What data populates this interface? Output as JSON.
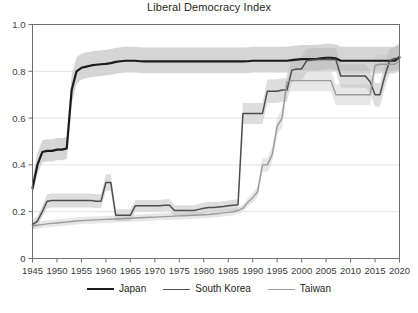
{
  "chart_data": {
    "type": "line",
    "title": "Liberal Democracy Index",
    "xlabel": "",
    "ylabel": "",
    "xlim": [
      1945,
      2020
    ],
    "ylim": [
      0,
      1.0
    ],
    "grid": true,
    "grid_axis": "y",
    "legend_position": "bottom",
    "xticks": [
      1945,
      1950,
      1955,
      1960,
      1965,
      1970,
      1975,
      1980,
      1985,
      1990,
      1995,
      2000,
      2005,
      2010,
      2015,
      2020
    ],
    "xtick_labels": [
      "1945",
      "1950",
      "1955",
      "1960",
      "1965",
      "1970",
      "1975",
      "1980",
      "1985",
      "1990",
      "1995",
      "2000",
      "2005",
      "2010",
      "2015",
      "2020"
    ],
    "yticks": [
      0,
      0.2,
      0.4,
      0.6,
      0.8,
      1.0
    ],
    "ytick_labels": [
      "0",
      "0.2",
      "0.4",
      "0.6",
      "0.8",
      "1.0"
    ],
    "series": [
      {
        "name": "Japan",
        "color": "#1a1a1a",
        "width": 2.2,
        "band_color": "#b3b3b3",
        "band_opacity": 0.55,
        "x": [
          1945,
          1946,
          1947,
          1948,
          1949,
          1950,
          1951,
          1952,
          1953,
          1954,
          1955,
          1956,
          1957,
          1958,
          1959,
          1960,
          1961,
          1962,
          1963,
          1964,
          1965,
          1966,
          1967,
          1968,
          1969,
          1970,
          1971,
          1972,
          1973,
          1974,
          1975,
          1976,
          1977,
          1978,
          1979,
          1980,
          1981,
          1982,
          1983,
          1984,
          1985,
          1986,
          1987,
          1988,
          1989,
          1990,
          1991,
          1992,
          1993,
          1994,
          1995,
          1996,
          1997,
          1998,
          1999,
          2000,
          2001,
          2002,
          2003,
          2004,
          2005,
          2006,
          2007,
          2008,
          2009,
          2010,
          2011,
          2012,
          2013,
          2014,
          2015,
          2016,
          2017,
          2018,
          2019,
          2020
        ],
        "y": [
          0.3,
          0.4,
          0.455,
          0.46,
          0.46,
          0.465,
          0.465,
          0.47,
          0.72,
          0.8,
          0.815,
          0.82,
          0.825,
          0.828,
          0.83,
          0.832,
          0.835,
          0.84,
          0.843,
          0.845,
          0.845,
          0.845,
          0.843,
          0.842,
          0.842,
          0.842,
          0.842,
          0.842,
          0.842,
          0.842,
          0.842,
          0.842,
          0.842,
          0.842,
          0.842,
          0.842,
          0.842,
          0.842,
          0.842,
          0.842,
          0.842,
          0.842,
          0.842,
          0.842,
          0.843,
          0.845,
          0.845,
          0.845,
          0.845,
          0.845,
          0.845,
          0.845,
          0.845,
          0.848,
          0.85,
          0.852,
          0.852,
          0.852,
          0.852,
          0.855,
          0.858,
          0.858,
          0.855,
          0.845,
          0.845,
          0.845,
          0.845,
          0.845,
          0.845,
          0.845,
          0.845,
          0.845,
          0.845,
          0.845,
          0.845,
          0.86
        ],
        "y_low": [
          0.27,
          0.36,
          0.41,
          0.415,
          0.415,
          0.42,
          0.42,
          0.425,
          0.66,
          0.745,
          0.765,
          0.77,
          0.775,
          0.778,
          0.78,
          0.782,
          0.785,
          0.79,
          0.793,
          0.795,
          0.795,
          0.795,
          0.793,
          0.792,
          0.792,
          0.792,
          0.792,
          0.792,
          0.792,
          0.792,
          0.792,
          0.792,
          0.792,
          0.792,
          0.792,
          0.792,
          0.792,
          0.792,
          0.792,
          0.792,
          0.792,
          0.792,
          0.792,
          0.792,
          0.793,
          0.795,
          0.795,
          0.795,
          0.795,
          0.795,
          0.795,
          0.795,
          0.795,
          0.798,
          0.8,
          0.802,
          0.802,
          0.802,
          0.802,
          0.805,
          0.808,
          0.808,
          0.805,
          0.795,
          0.795,
          0.795,
          0.795,
          0.795,
          0.795,
          0.795,
          0.795,
          0.795,
          0.795,
          0.795,
          0.795,
          0.81
        ],
        "y_high": [
          0.34,
          0.45,
          0.505,
          0.51,
          0.51,
          0.515,
          0.515,
          0.52,
          0.785,
          0.86,
          0.875,
          0.88,
          0.885,
          0.888,
          0.89,
          0.892,
          0.895,
          0.9,
          0.903,
          0.905,
          0.905,
          0.905,
          0.903,
          0.902,
          0.902,
          0.902,
          0.902,
          0.902,
          0.902,
          0.902,
          0.902,
          0.902,
          0.902,
          0.902,
          0.902,
          0.902,
          0.902,
          0.902,
          0.902,
          0.902,
          0.902,
          0.902,
          0.902,
          0.902,
          0.903,
          0.905,
          0.905,
          0.905,
          0.905,
          0.905,
          0.905,
          0.905,
          0.905,
          0.908,
          0.91,
          0.912,
          0.912,
          0.912,
          0.912,
          0.915,
          0.918,
          0.918,
          0.915,
          0.905,
          0.905,
          0.905,
          0.905,
          0.905,
          0.905,
          0.905,
          0.905,
          0.905,
          0.905,
          0.905,
          0.905,
          0.92
        ]
      },
      {
        "name": "South Korea",
        "color": "#4d4d4d",
        "width": 1.5,
        "band_color": "#b3b3b3",
        "band_opacity": 0.45,
        "x": [
          1945,
          1946,
          1947,
          1948,
          1949,
          1950,
          1951,
          1952,
          1953,
          1954,
          1955,
          1956,
          1957,
          1958,
          1959,
          1960,
          1961,
          1962,
          1963,
          1964,
          1965,
          1966,
          1967,
          1968,
          1969,
          1970,
          1971,
          1972,
          1973,
          1974,
          1975,
          1976,
          1977,
          1978,
          1979,
          1980,
          1981,
          1982,
          1983,
          1984,
          1985,
          1986,
          1987,
          1988,
          1989,
          1990,
          1991,
          1992,
          1993,
          1994,
          1995,
          1996,
          1997,
          1998,
          1999,
          2000,
          2001,
          2002,
          2003,
          2004,
          2005,
          2006,
          2007,
          2008,
          2009,
          2010,
          2011,
          2012,
          2013,
          2014,
          2015,
          2016,
          2017,
          2018,
          2019,
          2020
        ],
        "y": [
          0.145,
          0.16,
          0.2,
          0.245,
          0.248,
          0.248,
          0.248,
          0.248,
          0.248,
          0.248,
          0.248,
          0.248,
          0.248,
          0.245,
          0.245,
          0.325,
          0.325,
          0.185,
          0.185,
          0.185,
          0.185,
          0.225,
          0.225,
          0.225,
          0.225,
          0.225,
          0.225,
          0.228,
          0.228,
          0.205,
          0.205,
          0.205,
          0.205,
          0.205,
          0.21,
          0.215,
          0.218,
          0.218,
          0.22,
          0.222,
          0.225,
          0.228,
          0.23,
          0.62,
          0.62,
          0.62,
          0.62,
          0.62,
          0.715,
          0.715,
          0.715,
          0.72,
          0.72,
          0.805,
          0.81,
          0.81,
          0.845,
          0.848,
          0.85,
          0.85,
          0.85,
          0.85,
          0.85,
          0.78,
          0.78,
          0.78,
          0.78,
          0.78,
          0.78,
          0.755,
          0.7,
          0.7,
          0.78,
          0.845,
          0.855,
          0.855
        ],
        "y_low": [
          0.125,
          0.14,
          0.175,
          0.215,
          0.218,
          0.218,
          0.218,
          0.218,
          0.218,
          0.218,
          0.218,
          0.218,
          0.218,
          0.215,
          0.215,
          0.29,
          0.29,
          0.16,
          0.16,
          0.16,
          0.16,
          0.2,
          0.2,
          0.2,
          0.2,
          0.2,
          0.2,
          0.203,
          0.203,
          0.182,
          0.182,
          0.182,
          0.182,
          0.182,
          0.187,
          0.192,
          0.195,
          0.195,
          0.197,
          0.199,
          0.202,
          0.205,
          0.207,
          0.575,
          0.575,
          0.575,
          0.575,
          0.575,
          0.665,
          0.665,
          0.665,
          0.67,
          0.67,
          0.755,
          0.76,
          0.76,
          0.795,
          0.798,
          0.8,
          0.8,
          0.8,
          0.8,
          0.8,
          0.73,
          0.73,
          0.73,
          0.73,
          0.73,
          0.73,
          0.705,
          0.65,
          0.65,
          0.73,
          0.795,
          0.805,
          0.805
        ],
        "y_high": [
          0.165,
          0.18,
          0.225,
          0.275,
          0.278,
          0.278,
          0.278,
          0.278,
          0.278,
          0.278,
          0.278,
          0.278,
          0.278,
          0.275,
          0.275,
          0.36,
          0.36,
          0.21,
          0.21,
          0.21,
          0.21,
          0.25,
          0.25,
          0.25,
          0.25,
          0.25,
          0.25,
          0.253,
          0.253,
          0.228,
          0.228,
          0.228,
          0.228,
          0.228,
          0.233,
          0.238,
          0.241,
          0.241,
          0.243,
          0.245,
          0.248,
          0.251,
          0.253,
          0.665,
          0.665,
          0.665,
          0.665,
          0.665,
          0.765,
          0.765,
          0.765,
          0.77,
          0.77,
          0.855,
          0.86,
          0.86,
          0.895,
          0.898,
          0.9,
          0.9,
          0.9,
          0.9,
          0.9,
          0.83,
          0.83,
          0.83,
          0.83,
          0.83,
          0.83,
          0.805,
          0.75,
          0.75,
          0.83,
          0.895,
          0.905,
          0.905
        ]
      },
      {
        "name": "Taiwan",
        "color": "#9a9a9a",
        "width": 1.4,
        "band_color": "#c4c4c4",
        "band_opacity": 0.4,
        "x": [
          1945,
          1946,
          1947,
          1948,
          1949,
          1950,
          1951,
          1952,
          1953,
          1954,
          1955,
          1956,
          1957,
          1958,
          1959,
          1960,
          1961,
          1962,
          1963,
          1964,
          1965,
          1966,
          1967,
          1968,
          1969,
          1970,
          1971,
          1972,
          1973,
          1974,
          1975,
          1976,
          1977,
          1978,
          1979,
          1980,
          1981,
          1982,
          1983,
          1984,
          1985,
          1986,
          1987,
          1988,
          1989,
          1990,
          1991,
          1992,
          1993,
          1994,
          1995,
          1996,
          1997,
          1998,
          1999,
          2000,
          2001,
          2002,
          2003,
          2004,
          2005,
          2006,
          2007,
          2008,
          2009,
          2010,
          2011,
          2012,
          2013,
          2014,
          2015,
          2016,
          2017,
          2018,
          2019,
          2020
        ],
        "y": [
          0.14,
          0.142,
          0.145,
          0.148,
          0.15,
          0.152,
          0.154,
          0.156,
          0.158,
          0.16,
          0.162,
          0.163,
          0.164,
          0.165,
          0.166,
          0.167,
          0.168,
          0.169,
          0.17,
          0.171,
          0.172,
          0.173,
          0.174,
          0.175,
          0.176,
          0.177,
          0.178,
          0.179,
          0.18,
          0.181,
          0.182,
          0.183,
          0.184,
          0.185,
          0.186,
          0.187,
          0.188,
          0.19,
          0.192,
          0.195,
          0.197,
          0.2,
          0.205,
          0.215,
          0.24,
          0.26,
          0.285,
          0.4,
          0.4,
          0.445,
          0.565,
          0.6,
          0.755,
          0.76,
          0.76,
          0.76,
          0.76,
          0.76,
          0.76,
          0.76,
          0.76,
          0.76,
          0.7,
          0.7,
          0.7,
          0.7,
          0.7,
          0.7,
          0.7,
          0.7,
          0.825,
          0.83,
          0.83,
          0.83,
          0.83,
          0.845
        ],
        "y_low": [
          0.125,
          0.127,
          0.13,
          0.133,
          0.135,
          0.137,
          0.139,
          0.141,
          0.143,
          0.145,
          0.147,
          0.148,
          0.149,
          0.15,
          0.151,
          0.152,
          0.153,
          0.154,
          0.155,
          0.156,
          0.157,
          0.158,
          0.159,
          0.16,
          0.161,
          0.162,
          0.163,
          0.164,
          0.165,
          0.166,
          0.167,
          0.168,
          0.169,
          0.17,
          0.171,
          0.172,
          0.173,
          0.175,
          0.177,
          0.18,
          0.182,
          0.185,
          0.19,
          0.2,
          0.222,
          0.24,
          0.262,
          0.37,
          0.37,
          0.412,
          0.528,
          0.56,
          0.71,
          0.715,
          0.715,
          0.715,
          0.715,
          0.715,
          0.715,
          0.715,
          0.715,
          0.715,
          0.655,
          0.655,
          0.655,
          0.655,
          0.655,
          0.655,
          0.655,
          0.655,
          0.785,
          0.79,
          0.79,
          0.79,
          0.79,
          0.8
        ],
        "y_high": [
          0.155,
          0.157,
          0.16,
          0.163,
          0.165,
          0.167,
          0.169,
          0.171,
          0.173,
          0.175,
          0.177,
          0.178,
          0.179,
          0.18,
          0.181,
          0.182,
          0.183,
          0.184,
          0.185,
          0.186,
          0.187,
          0.188,
          0.189,
          0.19,
          0.191,
          0.192,
          0.193,
          0.194,
          0.195,
          0.196,
          0.197,
          0.198,
          0.199,
          0.2,
          0.201,
          0.202,
          0.203,
          0.205,
          0.207,
          0.21,
          0.212,
          0.215,
          0.22,
          0.23,
          0.258,
          0.28,
          0.308,
          0.43,
          0.43,
          0.478,
          0.602,
          0.64,
          0.8,
          0.805,
          0.805,
          0.805,
          0.805,
          0.805,
          0.805,
          0.805,
          0.805,
          0.805,
          0.745,
          0.745,
          0.745,
          0.745,
          0.745,
          0.745,
          0.745,
          0.745,
          0.865,
          0.87,
          0.87,
          0.87,
          0.87,
          0.89
        ]
      }
    ]
  },
  "legend": {
    "items": [
      {
        "label": "Japan",
        "color": "#1a1a1a",
        "width": "2.4px"
      },
      {
        "label": "South Korea",
        "color": "#4d4d4d",
        "width": "1.7px"
      },
      {
        "label": "Taiwan",
        "color": "#9a9a9a",
        "width": "1.6px"
      }
    ]
  },
  "axes": {
    "grid_color": "#d9d9d9",
    "frame_color": "#6e6e6e",
    "tick_color": "#6e6e6e"
  }
}
